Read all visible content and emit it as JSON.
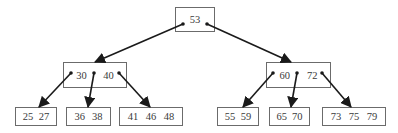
{
  "diagram": {
    "type": "b-tree",
    "colors": {
      "line": "#1a1a1a",
      "border": "#6b6b6b",
      "text": "#3a3a3a",
      "background": "#ffffff"
    },
    "nodes": [
      {
        "id": "root",
        "keys": [
          "53"
        ],
        "x": 175,
        "y": 7,
        "w": 40,
        "h": 25
      },
      {
        "id": "internal-left",
        "keys": [
          "30",
          "40"
        ],
        "x": 63,
        "y": 62,
        "w": 64,
        "h": 26
      },
      {
        "id": "internal-right",
        "keys": [
          "60",
          "72"
        ],
        "x": 266,
        "y": 62,
        "w": 65,
        "h": 26
      },
      {
        "id": "leaf-1",
        "keys": [
          "25",
          "27"
        ],
        "x": 15,
        "y": 107,
        "w": 42,
        "h": 19
      },
      {
        "id": "leaf-2",
        "keys": [
          "36",
          "38"
        ],
        "x": 66,
        "y": 107,
        "w": 45,
        "h": 19
      },
      {
        "id": "leaf-3",
        "keys": [
          "41",
          "46",
          "48"
        ],
        "x": 119,
        "y": 107,
        "w": 64,
        "h": 19
      },
      {
        "id": "leaf-4",
        "keys": [
          "55",
          "59"
        ],
        "x": 217,
        "y": 107,
        "w": 42,
        "h": 19
      },
      {
        "id": "leaf-5",
        "keys": [
          "65",
          "70"
        ],
        "x": 269,
        "y": 107,
        "w": 41,
        "h": 19
      },
      {
        "id": "leaf-6",
        "keys": [
          "73",
          "75",
          "79"
        ],
        "x": 322,
        "y": 107,
        "w": 64,
        "h": 19
      }
    ],
    "edges": [
      {
        "from": "root",
        "to": "internal-left",
        "x1": 183,
        "y1": 24,
        "x2": 95,
        "y2": 62
      },
      {
        "from": "root",
        "to": "internal-right",
        "x1": 207,
        "y1": 24,
        "x2": 291,
        "y2": 62
      },
      {
        "from": "internal-left",
        "to": "leaf-1",
        "x1": 71,
        "y1": 73,
        "x2": 39,
        "y2": 107
      },
      {
        "from": "internal-left",
        "to": "leaf-2",
        "x1": 94,
        "y1": 73,
        "x2": 88,
        "y2": 107
      },
      {
        "from": "internal-left",
        "to": "leaf-3",
        "x1": 119,
        "y1": 73,
        "x2": 150,
        "y2": 107
      },
      {
        "from": "internal-right",
        "to": "leaf-4",
        "x1": 273,
        "y1": 73,
        "x2": 243,
        "y2": 107
      },
      {
        "from": "internal-right",
        "to": "leaf-5",
        "x1": 297,
        "y1": 73,
        "x2": 291,
        "y2": 107
      },
      {
        "from": "internal-right",
        "to": "leaf-6",
        "x1": 322,
        "y1": 73,
        "x2": 351,
        "y2": 107
      }
    ]
  }
}
